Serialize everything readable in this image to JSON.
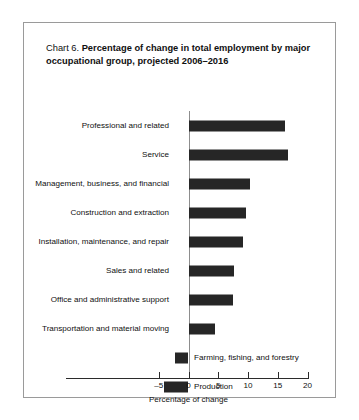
{
  "figure": {
    "chart_number": "Chart 6.",
    "title": "Percentage of change in total employment by major occupational group, projected 2006–2016"
  },
  "axis": {
    "x_title": "Percentage of change",
    "ticks": [
      "–5",
      "0",
      "5",
      "10",
      "15",
      "20"
    ]
  },
  "chart_data": {
    "type": "bar",
    "orientation": "horizontal",
    "title": "Chart 6. Percentage of change in total employment by major occupational group, projected 2006–2016",
    "xlabel": "Percentage of change",
    "ylabel": "",
    "xlim": [
      -5,
      20
    ],
    "xticks": [
      -5,
      0,
      5,
      10,
      15,
      20
    ],
    "grid": false,
    "legend": false,
    "bar_color": "#262626",
    "categories": [
      "Professional and related",
      "Service",
      "Management, business, and financial",
      "Construction and extraction",
      "Installation, maintenance, and repair",
      "Sales and related",
      "Office and administrative support",
      "Transportation and material moving",
      "Farming, fishing, and forestry",
      "Production"
    ],
    "values": [
      16.3,
      16.7,
      10.3,
      9.6,
      9.2,
      7.6,
      7.5,
      4.5,
      -2.2,
      -4.2
    ],
    "label_side": [
      "left",
      "left",
      "left",
      "left",
      "left",
      "left",
      "left",
      "left",
      "right",
      "right"
    ]
  }
}
